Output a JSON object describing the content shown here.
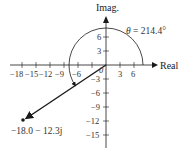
{
  "diagram": {
    "type": "complex-plane",
    "axes": {
      "x_label": "Real",
      "y_label": "Imag.",
      "x_ticks": [
        "−18",
        "−15",
        "−12",
        "−9",
        "−6",
        "3",
        "6"
      ],
      "y_ticks_pos": [
        "6",
        "3"
      ],
      "y_ticks_neg": [
        "−3",
        "−6",
        "−9",
        "−12",
        "−15"
      ],
      "origin_label": "0"
    },
    "point": {
      "label": "−18.0 − 12.3j",
      "real": -18.0,
      "imag": -12.3
    },
    "angle": {
      "symbol": "θ",
      "text": " = 214.4°",
      "degrees": 214.4
    },
    "colors": {
      "ink": "#1a1a1a",
      "labels": "#333333",
      "background": "#ffffff"
    }
  }
}
